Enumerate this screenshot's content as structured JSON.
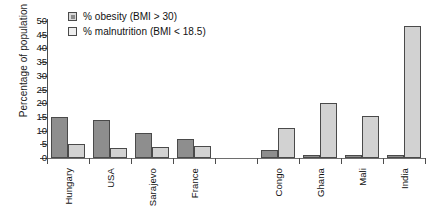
{
  "chart_data": {
    "type": "bar",
    "title": "",
    "xlabel": "",
    "ylabel": "Percentage of population",
    "ylim": [
      0,
      50
    ],
    "ytick_step": 5,
    "ytick_labels": [
      "50",
      "45",
      "40",
      "35",
      "30",
      "25",
      "20",
      "15",
      "10",
      "5",
      "0"
    ],
    "grid": false,
    "legend_position": "top-left",
    "categories": [
      "Hungary",
      "USA",
      "Sarajevo",
      "France",
      "",
      "Congo",
      "Ghana",
      "Mali",
      "India"
    ],
    "series": [
      {
        "name": "% obesity (BMI > 30)",
        "color": "#8e8e8e",
        "values": [
          15,
          14,
          9,
          7,
          null,
          3,
          1,
          1,
          1
        ]
      },
      {
        "name": "% malnutrition (BMI < 18.5)",
        "color": "#d2d2d2",
        "values": [
          5,
          3.5,
          4,
          4.5,
          null,
          11,
          20,
          15.5,
          48
        ]
      }
    ]
  },
  "legend": {
    "items": [
      {
        "label": "% obesity (BMI > 30)",
        "swatch": "obesity-swatch-icon"
      },
      {
        "label": "% malnutrition (BMI < 18.5)",
        "swatch": "malnutrition-swatch-icon"
      }
    ]
  },
  "axes": {
    "y_title": "Percentage of population"
  }
}
